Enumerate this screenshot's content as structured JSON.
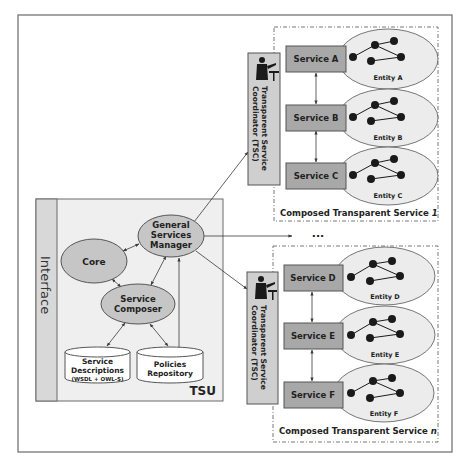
{
  "colors": {
    "frame": "#6a6a6a",
    "tsu_fill": "#efefef",
    "interface_fill": "#d8d8d8",
    "ellipse_fill": "#c6c6c6",
    "service_fill": "#a8a8a8",
    "tsc_fill": "#cfcfcf",
    "entity_fill": "#ececec",
    "db_fill": "#ffffff",
    "node": "#1a1a1a",
    "line": "#3a3a3a",
    "text": "#222222"
  },
  "tsu": {
    "label": "TSU",
    "interface_label": "Interface",
    "components": {
      "core": "Core",
      "gsm": [
        "General",
        "Services",
        "Manager"
      ],
      "composer": [
        "Service",
        "Composer"
      ]
    },
    "databases": {
      "service_descriptions": [
        "Service",
        "Descriptions",
        "(WSDL + OWL-S)"
      ],
      "policies": [
        "Policies",
        "Repository"
      ]
    }
  },
  "ellipsis": "...",
  "composed_services": [
    {
      "title": "Composed Transparent Service",
      "index": "1",
      "coordinator": [
        "Transparent Service",
        "Coordinator (TSC)"
      ],
      "services": [
        {
          "label": "Service A",
          "entity": "Entity A"
        },
        {
          "label": "Service B",
          "entity": "Entity B"
        },
        {
          "label": "Service C",
          "entity": "Entity C"
        }
      ]
    },
    {
      "title": "Composed Transparent Service",
      "index": "n",
      "coordinator": [
        "Transparent Service",
        "Coordinator (TSC)"
      ],
      "services": [
        {
          "label": "Service D",
          "entity": "Entity D"
        },
        {
          "label": "Service E",
          "entity": "Entity E"
        },
        {
          "label": "Service F",
          "entity": "Entity F"
        }
      ]
    }
  ]
}
